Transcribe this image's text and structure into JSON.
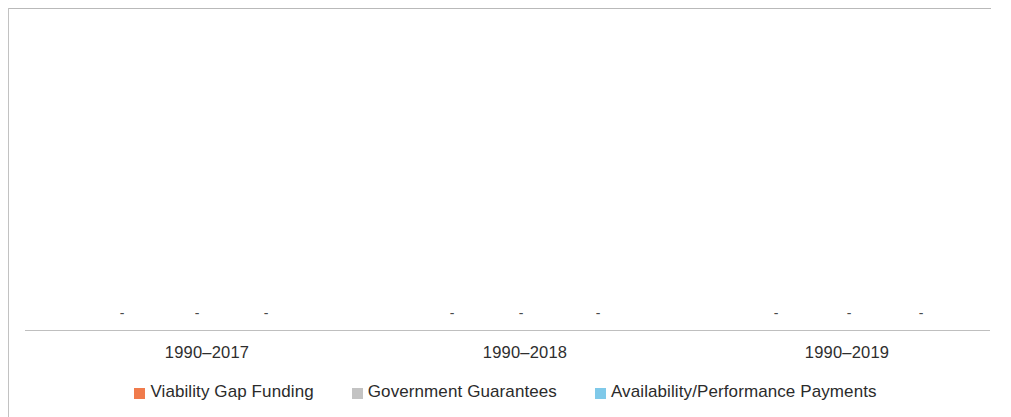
{
  "chart_data": {
    "type": "bar",
    "title": "",
    "subtitle": "",
    "xlabel": "",
    "ylabel": "",
    "grid": false,
    "legend_position": "bottom",
    "categories": [
      "1990–2017",
      "1990–2018",
      "1990–2019"
    ],
    "series": [
      {
        "name": "Viability Gap Funding",
        "color": "#F07B4C",
        "values": [
          0,
          0,
          0
        ],
        "data_labels": [
          "-",
          "-",
          "-"
        ]
      },
      {
        "name": "Government Guarantees",
        "color": "#C3C3C3",
        "values": [
          0,
          0,
          0
        ],
        "data_labels": [
          "-",
          "-",
          "-"
        ]
      },
      {
        "name": "Availability/Performance Payments",
        "color": "#7FC9E9",
        "values": [
          0,
          0,
          0
        ],
        "data_labels": [
          "-",
          "-",
          "-"
        ]
      }
    ],
    "ylim": [
      0,
      1
    ],
    "note": "All plotted values are zero; each bar is rendered only as a '-' data label on the baseline."
  },
  "axis": {
    "category_label_positions_px": [
      207,
      525,
      847
    ],
    "baseline_y_px": 330
  },
  "data_label_marks": [
    {
      "series": "Viability Gap Funding",
      "category": "1990–2017",
      "x_px": 122,
      "text": "-"
    },
    {
      "series": "Government Guarantees",
      "category": "1990–2017",
      "x_px": 197,
      "text": "-"
    },
    {
      "series": "Availability/Performance Payments",
      "category": "1990–2017",
      "x_px": 266,
      "text": "-"
    },
    {
      "series": "Viability Gap Funding",
      "category": "1990–2018",
      "x_px": 452,
      "text": "-"
    },
    {
      "series": "Government Guarantees",
      "category": "1990–2018",
      "x_px": 521,
      "text": "-"
    },
    {
      "series": "Availability/Performance Payments",
      "category": "1990–2018",
      "x_px": 598,
      "text": "-"
    },
    {
      "series": "Viability Gap Funding",
      "category": "1990–2019",
      "x_px": 776,
      "text": "-"
    },
    {
      "series": "Government Guarantees",
      "category": "1990–2019",
      "x_px": 849,
      "text": "-"
    },
    {
      "series": "Availability/Performance Payments",
      "category": "1990–2019",
      "x_px": 921,
      "text": "-"
    }
  ],
  "legend": {
    "items": [
      {
        "label": "Viability Gap Funding",
        "color": "#F07B4C"
      },
      {
        "label": "Government Guarantees",
        "color": "#C3C3C3"
      },
      {
        "label": "Availability/Performance Payments",
        "color": "#7FC9E9"
      }
    ]
  },
  "colors": {
    "frame": "#b9b9b9",
    "axis": "#bfbfbf",
    "text": "#2b2b2b",
    "label": "#4a4a4a",
    "background": "#ffffff"
  }
}
